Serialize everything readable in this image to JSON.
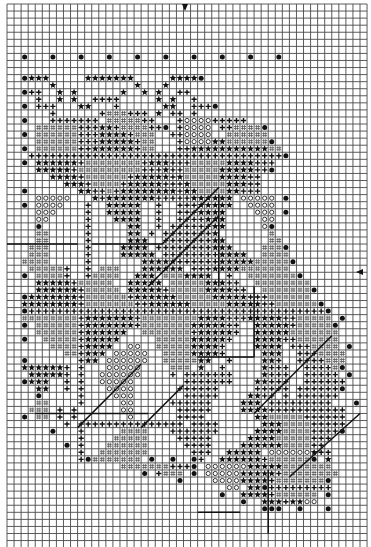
{
  "chart_data": {
    "type": "grid_pattern",
    "title": "",
    "grid": {
      "origin_x": 7,
      "origin_y": 4,
      "cell": 7.06,
      "cols": 51,
      "rows": 77,
      "line_color": "#4a4a4a",
      "bold_every": 0,
      "background": "#ffffff"
    },
    "center_markers": {
      "top_arrow_col": 25,
      "side_arrow_row": 38
    },
    "legend_symbols": {
      "*": "star",
      "+": "cross",
      "o": "diamond-open",
      "h": "hatched",
      "d": "dot"
    },
    "rows": [
      "...................................................",
      "...................................................",
      "...................................................",
      "...................................................",
      "...................................................",
      "...................................................",
      "...................................................",
      "..d...d...d...d...d...d...d...d...d...d...........",
      "...................................................",
      "...................................................",
      "..d***.....*******.....****d......................",
      "......*...........*...*...........................",
      "..d++..*.*......*..*.*..++........................",
      "....+..*.*..++++.....*.*..+.......................",
      "..d.+++...**...+......**..+++d....................",
      "......+......+hhh+++.*.++.+.......................",
      "..d...+++++++.hhhhh++...+oooo+++++................",
      "....hhhhhh+++**+hhhh++d.+oooo.++hhhhd.............",
      "..d.hhhhhh+++****+hhh..++oooo..hhhhhh.............",
      "....hhhhhh+++*****+hh...+oooo**hhhhhhd............",
      "..d.hhhhhh++******+hh...++***********hh...........",
      "...++++++++++++++++++++++++++++++++++++d..........",
      "..d.******+hhhhhhhh+***+++hhhhh****+++............",
      "....*****+hhhhhhhhh+++*++hhhhh*****++d............",
      "......****+hhhhhh+*****+*hhhhh****++..............",
      "........***+hhhh+*****+++*hhhhh***++..............",
      "..d.......**++h+********+**hhhh**+++..............",
      "....ooooo...*+*******+++++******.ooooo.d..........",
      "..d.oooo...+..*****..+..+++*****..oooo............",
      "....ooo....+..*****..+..+++****....ooo.d..........",
      "....oo.....+...****..+..++++***.....oo............",
      "....d......+.....**..+.++++++**.....od............",
      "....hh.....+.....**.+.+++++++*.......h............",
      "....hh.....+.....***..+++++++**......hh...........",
      "...hhh.....+....****.++++++++***....hhhd..........",
      "...hhh.....+....*****.++++++++****..hhhh..........",
      "..hhhh.....+.......*****++++++*****hhhhhd.........",
      "...hhhhh+..+.hhh...******.+++****hhhhhhh..........",
      "..d.hhhh+..+hhhh..***.hhh****..+..hhhhhhhd........",
      "....*****+hhhhh..*****.hhhhh***++..hhhhhhhh.......",
      "....******+hhhhh.*****+hhhhh****++..hhhhhhhd......",
      "..d*******+hhhhhh+******hhhhh*****+++hhhhhh.......",
      "..********+hhhhhhh++******hhhhh*****++hhhhhhd.....",
      "..d++++++++++++++++++++++++++++++++++++++++++d....",
      "..hhhhhhhh+*******+hhhhhhhh****+++*****++hhhhh.d..",
      "..d.hhhhhh+*******+hhhhhhh*****++..*****+hhhhhd...",
      "....hhhhhh+******..hhhhhhh+*****+..*****hhhhhhh...",
      "..d..hhhhh+*****.....hhhhh*****+...****++hhhhhh...",
      "......hhhh+****..oo..hhhhh****+....****.+++hhhh.d.",
      "........hh+***.ooooo..hhhh****+.....***..+++hhhh..",
      "..d.......+**.oooooo..hhhhh**..+....**+..++++hhh..",
      "..******+.+...ooooo....hhh.*..+.....*+++..++++hd..",
      "...*****+.+..oooooo....+.+++++++....*+++..+++++.d.",
      "..d***..+.+..ooooo.......+++++++...**+++..++++++..",
      "....**..+.+...oooo......++++++.....+++++.++++++d..",
      "....d.....+....ooo.......+++++....**++.+.++++++...",
      "....hh....+.....oo.....++++++....***.+++++++++...d",
      "...hhh.+.+......oo......+++++....****+++++++++++..",
      "..d.hh.+.+.......o......++++.......**hhhhh++++++..",
      "........+.+++++++++++++++.++++......***hhhh+++++..",
      "......d...+.....hhhh...+++++++.....****hhhh++++d..",
      "..........+....hhhhh....+++++.....****hhhhh+++....",
      "........d.+...hhhhhh.....++++....******hhhh++.....",
      "..........+..hhhhhhh......+++..*****.oooooo*++....",
      "..........+dhhhhhhh.d..d..d+..******+hhhhhhd.*....",
      "................hhhhhhh+++d.oooooo*****hhhhhhh....",
      "...................d.+hhh.d.ooooo*****+hhhhhhhh...",
      "........................d....oooo****+hhhhhhhd....",
      "...............................oo.**d+++++++++....",
      "..............................d..****+hhhhhh.d....",
      ".................................d..***+**oo......",
      "....................................ddd..d...d....",
      "...................................................",
      "...................................................",
      "...................................................",
      "...................................................",
      "..................................................."
    ],
    "lines": [
      [
        0.0,
        34.0,
        10.0,
        34.0
      ],
      [
        12.0,
        34.0,
        22.0,
        34.0
      ],
      [
        22.0,
        34.0,
        30.0,
        26.0
      ],
      [
        20.0,
        40.0,
        30.0,
        30.0
      ],
      [
        30.0,
        27.0,
        30.0,
        40.0
      ],
      [
        27.0,
        50.0,
        35.0,
        50.0
      ],
      [
        10.0,
        60.0,
        19.0,
        51.0
      ],
      [
        19.0,
        60.0,
        25.0,
        54.0
      ],
      [
        35.0,
        40.0,
        35.0,
        50.0
      ],
      [
        35.0,
        58.0,
        46.0,
        47.0
      ],
      [
        40.0,
        67.0,
        50.0,
        58.0
      ],
      [
        37.0,
        66.0,
        37.0,
        75.0
      ],
      [
        4.0,
        58.0,
        20.0,
        58.0
      ],
      [
        27.0,
        72.0,
        33.0,
        72.0
      ]
    ]
  }
}
